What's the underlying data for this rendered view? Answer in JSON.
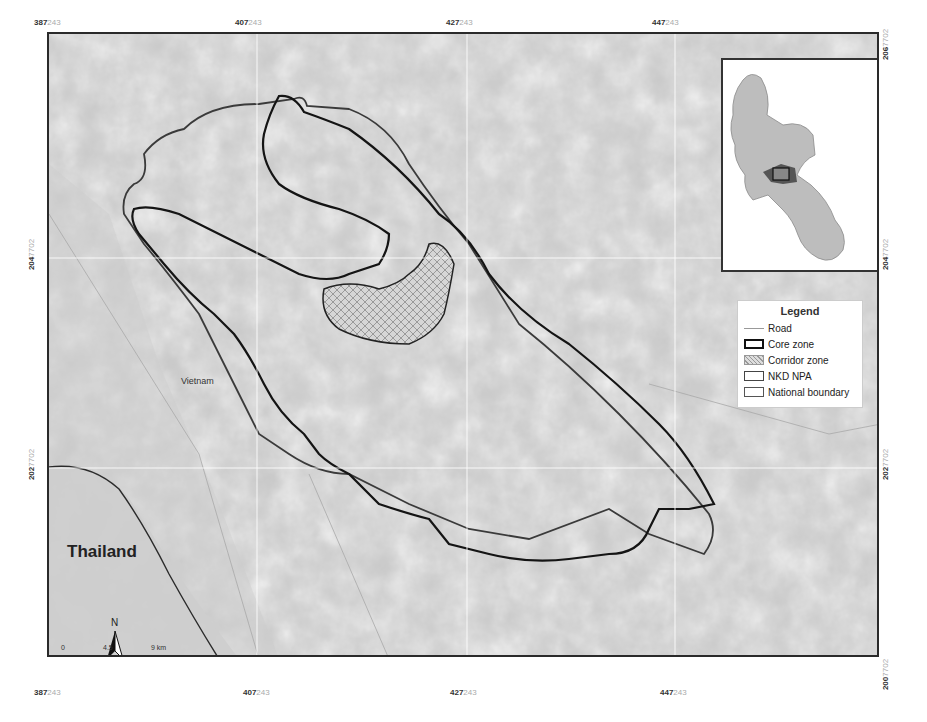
{
  "map": {
    "x_ticks": [
      {
        "major": "387",
        "minor": "243"
      },
      {
        "major": "407",
        "minor": "243"
      },
      {
        "major": "427",
        "minor": "243"
      },
      {
        "major": "447",
        "minor": "243"
      }
    ],
    "y_ticks": [
      {
        "major": "206",
        "minor": "7702"
      },
      {
        "major": "204",
        "minor": "7702"
      },
      {
        "major": "202",
        "minor": "7702"
      },
      {
        "major": "200",
        "minor": "7702"
      }
    ],
    "places": {
      "thailand": "Thailand",
      "vietnam": "Vietnam"
    },
    "north_label": "N",
    "scale": {
      "zero": "0",
      "mid": "4.5",
      "end": "9 km"
    }
  },
  "legend": {
    "title": "Legend",
    "items": [
      {
        "label": "Road"
      },
      {
        "label": "Core zone"
      },
      {
        "label": "Corridor zone"
      },
      {
        "label": "NKD NPA"
      },
      {
        "label": "National boundary"
      }
    ]
  },
  "colors": {
    "core_line": "#1a1a1a",
    "npa_line": "#3a3a3a",
    "terrain": "#c9c9c9",
    "inset_country": "#bdbdbd",
    "inset_highlight": "#555555"
  }
}
